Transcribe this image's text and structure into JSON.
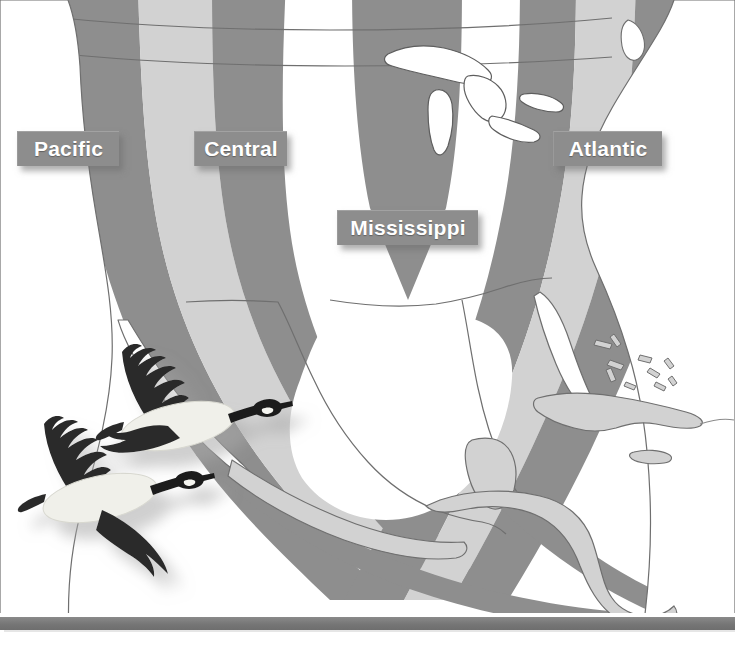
{
  "figure": {
    "kind": "map",
    "background_color": "#ffffff"
  },
  "map": {
    "region": "North America, Central America and the Caribbean",
    "land_fill": "#ffffff",
    "coast_stroke": "#7a7a7a",
    "band_dark_color": "#8e8e8e",
    "band_light_color": "#d2d2d2",
    "landmasses": [
      "Canada",
      "United States",
      "Mexico",
      "Central America",
      "Cuba",
      "Bahamas",
      "Jamaica",
      "Hispaniola",
      "Great Lakes"
    ]
  },
  "flyways": [
    {
      "id": "pacific",
      "label": "Pacific",
      "band_color": "#8e8e8e",
      "label_box": {
        "x": 17,
        "y": 131,
        "w": 102,
        "h": 35
      }
    },
    {
      "id": "central",
      "label": "Central",
      "band_color": "#d2d2d2",
      "label_box": {
        "x": 194,
        "y": 131,
        "w": 93,
        "h": 35
      }
    },
    {
      "id": "mississippi",
      "label": "Mississippi",
      "band_color": "#8e8e8e",
      "label_box": {
        "x": 337,
        "y": 210,
        "w": 141,
        "h": 35
      }
    },
    {
      "id": "atlantic",
      "label": "Atlantic",
      "band_color": "#8e8e8e",
      "label_box": {
        "x": 553,
        "y": 131,
        "w": 109,
        "h": 35
      }
    }
  ],
  "label_style": {
    "box_fill": "#8d8d8d",
    "text_color": "#ffffff",
    "font_weight": "bold",
    "font_size_px": 21,
    "has_drop_shadow": true
  },
  "illustration": {
    "name": "canada-geese",
    "count": 2,
    "description": "Two Canada geese flying to the right in profile",
    "body_color": "#f0f0ea",
    "wing_color": "#2b2b2b",
    "head_color": "#1f1f1f",
    "cheek_patch_color": "#f5f5f0",
    "shadow_color": "rgba(150,150,150,0.45)",
    "position": {
      "x": 20,
      "y": 330,
      "w": 290,
      "h": 250
    }
  },
  "bottom_bar": {
    "name": "footer-rule",
    "color": "#7a7a7a",
    "y": 617,
    "height": 13
  }
}
